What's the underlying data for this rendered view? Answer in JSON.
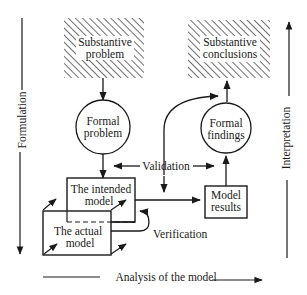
{
  "diagram": {
    "nodes": {
      "substantive_problem": {
        "line1": "Substantive",
        "line2": "problem"
      },
      "formal_problem": {
        "line1": "Formal",
        "line2": "problem"
      },
      "substantive_conclusions": {
        "line1": "Substantive",
        "line2": "conclusions"
      },
      "formal_findings": {
        "line1": "Formal",
        "line2": "findings"
      },
      "intended_model": {
        "line1": "The intended",
        "line2": "model"
      },
      "actual_model": {
        "line1": "The actual",
        "line2": "model"
      },
      "model_results": {
        "line1": "Model",
        "line2": "results"
      }
    },
    "labels": {
      "validation": "Validation",
      "verification": "Verification"
    },
    "axes": {
      "left": "Formulation",
      "right": "Interpretation",
      "bottom": "Analysis of the model"
    },
    "colors": {
      "ink": "#1a1a1a",
      "background": "#ffffff"
    }
  }
}
